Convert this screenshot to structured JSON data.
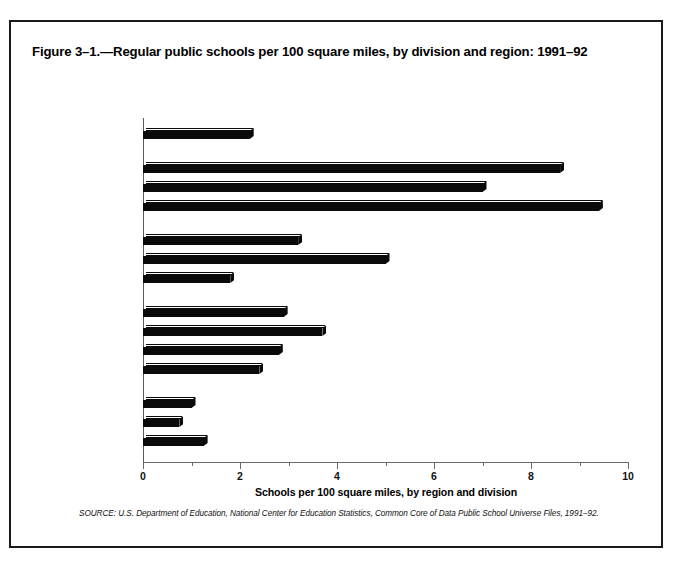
{
  "figure": {
    "title": "Figure 3–1.—Regular public schools per 100 square miles, by division and region: 1991–92",
    "source_note": "SOURCE: U.S. Department of Education, National Center for Education Statistics, Common Core of Data Public School Universe Files, 1991–92."
  },
  "chart_data": {
    "type": "bar",
    "orientation": "horizontal",
    "title": "Figure 3–1.—Regular public schools per 100 square miles, by division and region: 1991–92",
    "xlabel": "Schools per 100 square miles, by region and division",
    "ylabel": "",
    "xlim": [
      0,
      10
    ],
    "xticks": [
      0,
      2,
      4,
      6,
      8,
      10
    ],
    "xtick_labels": [
      "0",
      "2",
      "4",
      "6",
      "8",
      "10"
    ],
    "minor_xticks": [
      1,
      3,
      5,
      7,
      9
    ],
    "grid": false,
    "legend": false,
    "bar_color": "#0a0a0a",
    "categories": [
      "UNITED STATES",
      "NORTHEAST",
      "New England",
      "Mid-Atlantic",
      "NORTH CENTRAL",
      "Midwest",
      "West North Central",
      "SOUTH",
      "South Atlantic",
      "East South Central",
      "West South Central",
      "WEST",
      "Mountain",
      "Pacific"
    ],
    "values": [
      2.2,
      8.6,
      7.0,
      9.4,
      3.2,
      5.0,
      1.8,
      2.9,
      3.7,
      2.8,
      2.4,
      1.0,
      0.75,
      1.25
    ],
    "rows": [
      {
        "label": "UNITED STATES",
        "value": 2.2,
        "level": "region",
        "group": 0
      },
      {
        "label": "NORTHEAST",
        "value": 8.6,
        "level": "region",
        "group": 1
      },
      {
        "label": "New England",
        "value": 7.0,
        "level": "division",
        "group": 1
      },
      {
        "label": "Mid-Atlantic",
        "value": 9.4,
        "level": "division",
        "group": 1
      },
      {
        "label": "NORTH CENTRAL",
        "value": 3.2,
        "level": "region",
        "group": 2
      },
      {
        "label": "Midwest",
        "value": 5.0,
        "level": "division",
        "group": 2
      },
      {
        "label": "West North Central",
        "value": 1.8,
        "level": "division",
        "group": 2
      },
      {
        "label": "SOUTH",
        "value": 2.9,
        "level": "region",
        "group": 3
      },
      {
        "label": "South Atlantic",
        "value": 3.7,
        "level": "division",
        "group": 3
      },
      {
        "label": "East South Central",
        "value": 2.8,
        "level": "division",
        "group": 3
      },
      {
        "label": "West South Central",
        "value": 2.4,
        "level": "division",
        "group": 3
      },
      {
        "label": "WEST",
        "value": 1.0,
        "level": "region",
        "group": 4
      },
      {
        "label": "Mountain",
        "value": 0.75,
        "level": "division",
        "group": 4
      },
      {
        "label": "Pacific",
        "value": 1.25,
        "level": "division",
        "group": 4
      }
    ]
  }
}
